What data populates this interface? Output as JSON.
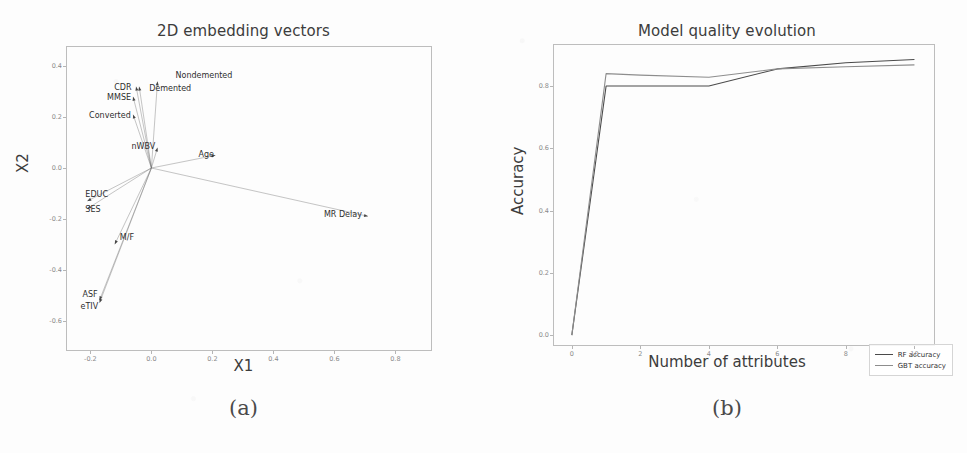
{
  "figure": {
    "captions": {
      "a": "(a)",
      "b": "(b)"
    }
  },
  "panel_a": {
    "title": "2D embedding vectors",
    "xlabel": "X1",
    "ylabel": "X2",
    "xticks": [
      "-0.2",
      "0.0",
      "0.2",
      "0.4",
      "0.6",
      "0.8"
    ],
    "yticks": [
      "0.4",
      "0.2",
      "0.0",
      "-0.2",
      "-0.4",
      "-0.6"
    ]
  },
  "panel_b": {
    "title": "Model quality evolution",
    "xlabel": "Number of attributes",
    "ylabel": "Accuracy",
    "xticks": [
      "0",
      "2",
      "4",
      "6",
      "8",
      "10"
    ],
    "yticks": [
      "0.0",
      "0.2",
      "0.4",
      "0.6",
      "0.8"
    ],
    "legend": [
      {
        "label": "RF accuracy",
        "color": "#4a4a4a"
      },
      {
        "label": "GBT accuracy",
        "color": "#8d8d8d"
      }
    ]
  },
  "chart_data": [
    {
      "type": "scatter",
      "title": "2D embedding vectors",
      "xlabel": "X1",
      "ylabel": "X2",
      "xlim": [
        -0.28,
        0.92
      ],
      "ylim": [
        -0.72,
        0.48
      ],
      "grid": false,
      "legend": "none",
      "note": "Biplot-style loading vectors drawn from origin; each point is the arrow tip labelled with its attribute name.",
      "points": [
        {
          "label": "Nondemented",
          "x": 0.02,
          "y": 0.34,
          "label_dx": 18,
          "label_dy": -6
        },
        {
          "label": "Demented",
          "x": -0.04,
          "y": 0.32,
          "label_dx": 10,
          "label_dy": 2
        },
        {
          "label": "CDR",
          "x": -0.05,
          "y": 0.32,
          "label_dx": -22,
          "label_dy": 1
        },
        {
          "label": "MMSE",
          "x": -0.06,
          "y": 0.28,
          "label_dx": -26,
          "label_dy": 1
        },
        {
          "label": "Converted",
          "x": -0.06,
          "y": 0.21,
          "label_dx": -44,
          "label_dy": 1
        },
        {
          "label": "nWBV",
          "x": 0.02,
          "y": 0.08,
          "label_dx": -26,
          "label_dy": -1
        },
        {
          "label": "Age",
          "x": 0.21,
          "y": 0.05,
          "label_dx": -17,
          "label_dy": 0
        },
        {
          "label": "EDUC",
          "x": -0.21,
          "y": -0.13,
          "label_dx": -2,
          "label_dy": -6
        },
        {
          "label": "SES",
          "x": -0.21,
          "y": -0.16,
          "label_dx": -2,
          "label_dy": 1
        },
        {
          "label": "MR Delay",
          "x": 0.71,
          "y": -0.19,
          "label_dx": -44,
          "label_dy": -1
        },
        {
          "label": "M/F",
          "x": -0.12,
          "y": -0.3,
          "label_dx": 5,
          "label_dy": -6
        },
        {
          "label": "ASF",
          "x": -0.17,
          "y": -0.52,
          "label_dx": -17,
          "label_dy": -5
        },
        {
          "label": "eTIV",
          "x": -0.17,
          "y": -0.53,
          "label_dx": -19,
          "label_dy": 4
        }
      ]
    },
    {
      "type": "line",
      "title": "Model quality evolution",
      "xlabel": "Number of attributes",
      "ylabel": "Accuracy",
      "x": [
        0,
        1,
        2,
        4,
        6,
        8,
        10
      ],
      "xlim": [
        -0.55,
        10.6
      ],
      "ylim": [
        -0.035,
        0.935
      ],
      "grid": false,
      "legend": "lower right",
      "series": [
        {
          "name": "RF accuracy",
          "color": "#4a4a4a",
          "values": [
            0.0,
            0.8,
            0.8,
            0.8,
            0.855,
            0.875,
            0.885
          ]
        },
        {
          "name": "GBT accuracy",
          "color": "#8d8d8d",
          "values": [
            0.0,
            0.84,
            0.835,
            0.828,
            0.855,
            0.862,
            0.868
          ]
        }
      ]
    }
  ]
}
